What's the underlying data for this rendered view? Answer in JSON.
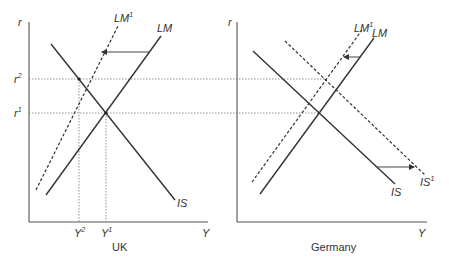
{
  "panels": [
    {
      "title": "UK",
      "y_axis_label": "r",
      "x_axis_label": "Y",
      "curves": [
        {
          "name": "LM",
          "label": "LM",
          "style": "solid"
        },
        {
          "name": "LM1",
          "label": "LM",
          "sup": "1",
          "style": "dashed"
        },
        {
          "name": "IS",
          "label": "IS",
          "style": "solid"
        }
      ],
      "r_ticks": [
        {
          "label": "r",
          "sup": "2"
        },
        {
          "label": "r",
          "sup": "1"
        }
      ],
      "y_ticks": [
        {
          "label": "Y",
          "sup": "2"
        },
        {
          "label": "Y",
          "sup": "1"
        }
      ],
      "shift": "LM shifts left to LM1"
    },
    {
      "title": "Germany",
      "y_axis_label": "r",
      "x_axis_label": "Y",
      "curves": [
        {
          "name": "LM",
          "label": "LM",
          "style": "solid"
        },
        {
          "name": "LM1",
          "label": "LM",
          "sup": "1",
          "style": "dashed"
        },
        {
          "name": "IS",
          "label": "IS",
          "style": "solid"
        },
        {
          "name": "IS1",
          "label": "IS",
          "sup": "1",
          "style": "dashed"
        }
      ],
      "shift": "LM shifts left to LM1; IS shifts right to IS1"
    }
  ],
  "colors": {
    "line": "#333333",
    "axis": "#555555",
    "guide": "#777777",
    "background": "#ffffff"
  }
}
